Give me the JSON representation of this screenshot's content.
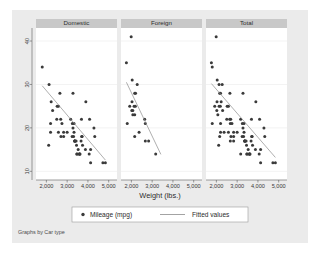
{
  "figure": {
    "note": "Graphs by Car type",
    "background_color": "#ebebeb",
    "panel_title_fill": "#c8c8c8",
    "marker_color": "#3a3a3a",
    "line_color": "#8c8c8c",
    "panel_bg": "#ffffff"
  },
  "legend": {
    "marker_label": "Mileage (mpg)",
    "line_label": "Fitted values",
    "marker_icon": "filled-circle-icon",
    "line_icon": "line-segment-icon"
  },
  "chart_data": {
    "type": "scatter",
    "title": "",
    "subtitle": "",
    "xlabel": "Weight (lbs.)",
    "ylabel": "",
    "xlim": [
      1500,
      5400
    ],
    "ylim": [
      8,
      43
    ],
    "xticks": [
      2000,
      3000,
      4000,
      5000
    ],
    "xtick_labels": [
      "2,000",
      "3,000",
      "4,000",
      "5,000"
    ],
    "yticks": [
      10,
      20,
      30,
      40
    ],
    "ytick_labels": [
      "10",
      "20",
      "30",
      "40"
    ],
    "grid": true,
    "grid_axis": "y",
    "legend_position": "bottom",
    "panel_by": "Car type",
    "panels": [
      {
        "label": "Domestic",
        "series": [
          {
            "name": "Mileage (mpg)",
            "type": "scatter",
            "x": [
              4080,
              3670,
              3690,
              3280,
              3880,
              4330,
              3900,
              4290,
              2110,
              2200,
              2690,
              3470,
              3600,
              3330,
              3700,
              3470,
              3600,
              3740,
              3370,
              2830,
              3370,
              4130,
              4060,
              4130,
              3720,
              3370,
              3310,
              2830,
              3370,
              2580,
              2200,
              2520,
              3330,
              2300,
              2700,
              2230,
              3280,
              2750,
              3430,
              3000,
              2500,
              3620,
              3530,
              3240,
              3450,
              3570,
              4840,
              4720,
              1800,
              2580,
              2130,
              3250,
              3170,
              2650
            ],
            "y": [
              22,
              17,
              22,
              20,
              15,
              18,
              26,
              20,
              16,
              19,
              22,
              14,
              14,
              21,
              18,
              14,
              14,
              16,
              17,
              18,
              17,
              15,
              14,
              12,
              18,
              17,
              18,
              19,
              17,
              19,
              21,
              25,
              19,
              24,
              18,
              26,
              28,
              21,
              17,
              19,
              22,
              14,
              15,
              18,
              16,
              14,
              12,
              12,
              34,
              25,
              30,
              21,
              22,
              28
            ]
          },
          {
            "name": "Fitted values",
            "type": "line",
            "x": [
              1800,
              4840
            ],
            "y": [
              29.7,
              12.6
            ]
          }
        ]
      },
      {
        "label": "Foreign",
        "series": [
          {
            "name": "Mileage (mpg)",
            "type": "scatter",
            "x": [
              2640,
              2830,
              2070,
              2130,
              1760,
              2020,
              1800,
              1920,
              2160,
              2670,
              2370,
              2200,
              2280,
              2030,
              2040,
              2160,
              1990,
              3170,
              2190,
              2670,
              2160,
              2070
            ],
            "y": [
              22,
              17,
              23,
              25,
              35,
              24,
              21,
              25,
              28,
              21,
              19,
              28,
              30,
              26,
              31,
              18,
              41,
              14,
              25,
              17,
              23,
              24
            ]
          },
          {
            "name": "Fitted values",
            "type": "line",
            "x": [
              1760,
              3420
            ],
            "y": [
              30.5,
              13.9
            ]
          }
        ]
      },
      {
        "label": "Total",
        "series": [
          {
            "name": "Mileage (mpg)",
            "type": "scatter",
            "x": [
              4080,
              3670,
              3690,
              3280,
              3880,
              4330,
              3900,
              4290,
              2110,
              2200,
              2690,
              3470,
              3600,
              3330,
              3700,
              3470,
              3600,
              3740,
              3370,
              2830,
              3370,
              4130,
              4060,
              4130,
              3720,
              3370,
              3310,
              2830,
              3370,
              2580,
              2200,
              2520,
              3330,
              2300,
              2700,
              2230,
              3280,
              2750,
              3430,
              3000,
              2500,
              3620,
              3530,
              3240,
              3450,
              3570,
              4840,
              4720,
              1800,
              2580,
              2130,
              3250,
              3170,
              2650,
              2640,
              2830,
              2070,
              2130,
              1760,
              2020,
              1800,
              1920,
              2160,
              2670,
              2370,
              2200,
              2280,
              2030,
              2040,
              2160,
              1990,
              3170,
              2190,
              2670
            ],
            "y": [
              22,
              17,
              22,
              20,
              15,
              18,
              26,
              20,
              16,
              19,
              22,
              14,
              14,
              21,
              18,
              14,
              14,
              16,
              17,
              18,
              17,
              15,
              14,
              12,
              18,
              17,
              18,
              19,
              17,
              19,
              21,
              25,
              19,
              24,
              18,
              26,
              28,
              21,
              17,
              19,
              22,
              14,
              15,
              18,
              16,
              14,
              12,
              12,
              34,
              25,
              30,
              21,
              22,
              28,
              22,
              17,
              23,
              25,
              35,
              24,
              21,
              25,
              28,
              21,
              19,
              28,
              30,
              26,
              31,
              18,
              41,
              14,
              25,
              17
            ]
          },
          {
            "name": "Fitted values",
            "type": "line",
            "x": [
              1760,
              4840
            ],
            "y": [
              30.2,
              13.2
            ]
          }
        ]
      }
    ]
  }
}
